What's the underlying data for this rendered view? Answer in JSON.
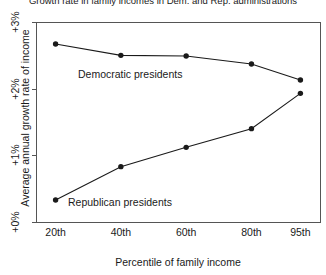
{
  "chart_data": {
    "type": "line",
    "title": "Growth rate in family incomes in Dem. and Rep. administrations",
    "xlabel": "Percentile of family income",
    "ylabel": "Average annual growth rate of income",
    "categories": [
      "20th",
      "40th",
      "60th",
      "80th",
      "95th"
    ],
    "x_positions": [
      20,
      40,
      60,
      80,
      95
    ],
    "xlim": [
      14,
      101
    ],
    "ylim": [
      0,
      3
    ],
    "ytick_labels": [
      "+0%",
      "+1%",
      "+2%",
      "+3%"
    ],
    "ytick_values": [
      0,
      1,
      2,
      3
    ],
    "grid": false,
    "legend": "inline-annotations",
    "marker": "filled-circle",
    "line_color": "#1a1a1a",
    "series": [
      {
        "name": "Democratic presidents",
        "values": [
          2.67,
          2.5,
          2.49,
          2.37,
          2.13
        ],
        "label_x": 78,
        "label_y": 68
      },
      {
        "name": "Republican presidents",
        "values": [
          0.33,
          0.83,
          1.12,
          1.4,
          1.93
        ],
        "label_x": 68,
        "label_y": 196
      }
    ]
  },
  "axes": {
    "plot_left": 36,
    "plot_right": 320,
    "plot_top": 22,
    "plot_bottom": 222
  }
}
